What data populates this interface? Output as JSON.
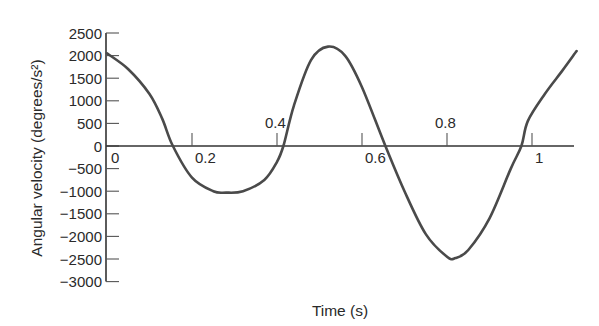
{
  "chart_data": {
    "type": "line",
    "title": "",
    "xlabel": "Time (s)",
    "ylabel": "Angular velocity (degrees/s²)",
    "xlim": [
      0,
      1.1
    ],
    "ylim": [
      -3000,
      2500
    ],
    "grid": false,
    "legend": null,
    "x_ticks": [
      0,
      0.2,
      0.4,
      0.6,
      0.8,
      1
    ],
    "x_tick_labels": [
      "0",
      "0.2",
      "0.4",
      "0.6",
      "0.8",
      "1"
    ],
    "y_ticks": [
      2500,
      2000,
      1500,
      1000,
      500,
      0,
      -500,
      -1000,
      -1500,
      -2000,
      -2500,
      -3000
    ],
    "y_tick_labels": [
      "2500",
      "2000",
      "1500",
      "1000",
      "500",
      "0",
      "−500",
      "−1000",
      "−1500",
      "−2000",
      "−2500",
      "−3000"
    ],
    "series": [
      {
        "name": "Angular velocity",
        "color": "#4a4a4a",
        "x": [
          0.0,
          0.05,
          0.1,
          0.13,
          0.155,
          0.2,
          0.25,
          0.28,
          0.32,
          0.37,
          0.4,
          0.415,
          0.44,
          0.48,
          0.52,
          0.56,
          0.6,
          0.655,
          0.7,
          0.75,
          0.8,
          0.82,
          0.85,
          0.9,
          0.95,
          0.975,
          0.99,
          1.03,
          1.07,
          1.105
        ],
        "values": [
          2050,
          1700,
          1150,
          600,
          0,
          -700,
          -1000,
          -1030,
          -1000,
          -750,
          -350,
          0,
          900,
          1900,
          2200,
          2000,
          1300,
          0,
          -1000,
          -1950,
          -2450,
          -2480,
          -2300,
          -1600,
          -500,
          0,
          550,
          1150,
          1650,
          2100
        ]
      }
    ]
  }
}
